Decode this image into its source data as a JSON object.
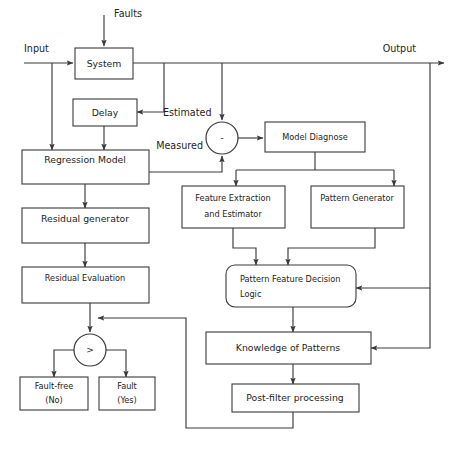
{
  "diagram": {
    "type": "block-diagram",
    "stroke_color": "#3a3a3a",
    "text_color": "#1d1d1d",
    "background_color": "#ffffff",
    "nodes": {
      "system": "System",
      "delay": "Delay",
      "regression_model": "Regression Model",
      "residual_generator": "Residual generator",
      "residual_evaluation": "Residual Evaluation",
      "fault_free": "Fault-free",
      "fault_free_sub": "(No)",
      "fault": "Fault",
      "fault_sub": "(Yes)",
      "model_diagnose": "Model Diagnose",
      "feature_extraction_line1": "Feature Extraction",
      "feature_extraction_line2": "and Estimator",
      "pattern_generator": "Pattern Generator",
      "decision_logic_line1": "Pattern Feature Decision",
      "decision_logic_line2": "Logic",
      "knowledge_of_patterns": "Knowledge of Patterns",
      "post_filter": "Post-filter processing"
    },
    "operators": {
      "summing_junction": "-",
      "comparator": ">"
    },
    "edge_labels": {
      "faults": "Faults",
      "input": "Input",
      "output": "Output",
      "estimated": "Estimated",
      "measured": "Measured"
    },
    "caption": ""
  }
}
